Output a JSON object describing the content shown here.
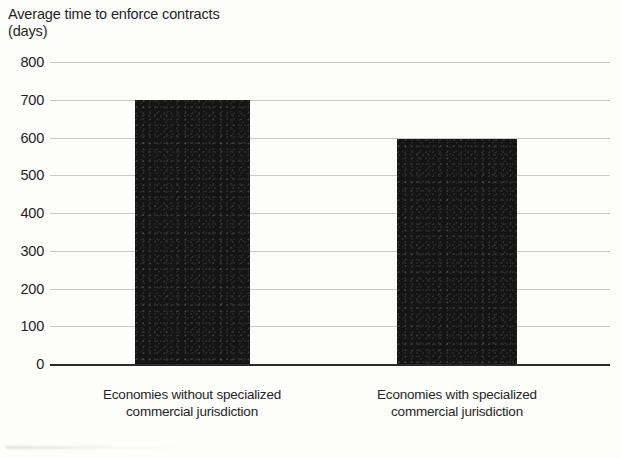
{
  "chart_data": {
    "type": "bar",
    "title": "Average time to enforce contracts",
    "subtitle": "(days)",
    "xlabel": "",
    "ylabel": "days",
    "ylim": [
      0,
      800
    ],
    "yticks": [
      800,
      700,
      600,
      500,
      400,
      300,
      200,
      100,
      0
    ],
    "ytick_labels": [
      "800",
      "700",
      "600",
      "500",
      "400",
      "300",
      "200",
      "100",
      "0"
    ],
    "grid": true,
    "legend": null,
    "categories": [
      "Economies without specialized\ncommercial jurisdiction",
      "Economies with specialized\ncommercial jurisdiction"
    ],
    "values": [
      700,
      595
    ],
    "bar_color": "#151515",
    "gridline_color": "#c9c9c9",
    "axis_color": "#2a2a2a",
    "background_color": "#fdfdfc"
  }
}
